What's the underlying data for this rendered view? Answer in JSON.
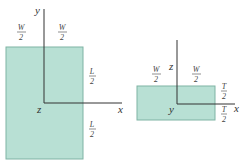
{
  "colors": {
    "plate_fill": "#b8e0d4",
    "plate_stroke": "#7fb3a4",
    "axis": "#333333",
    "text": "#333333"
  },
  "left_view": {
    "axes": {
      "vertical": "y",
      "horizontal": "x",
      "origin": "z"
    },
    "top_labels": [
      {
        "num": "W",
        "den": "2"
      },
      {
        "num": "W",
        "den": "2"
      }
    ],
    "side_labels": [
      {
        "num": "L",
        "den": "2"
      },
      {
        "num": "L",
        "den": "2"
      }
    ]
  },
  "right_view": {
    "axes": {
      "vertical": "z",
      "horizontal": "x",
      "origin": "y"
    },
    "top_labels": [
      {
        "num": "W",
        "den": "2"
      },
      {
        "num": "W",
        "den": "2"
      }
    ],
    "side_labels": [
      {
        "num": "T",
        "den": "2"
      },
      {
        "num": "T",
        "den": "2"
      }
    ]
  }
}
